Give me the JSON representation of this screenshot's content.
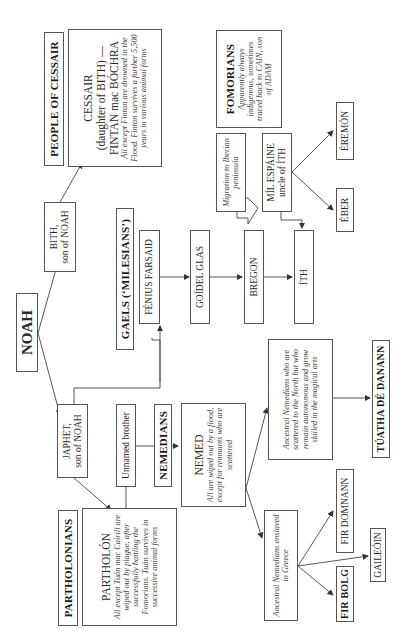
{
  "diagram": {
    "orientation": "rotated-90-ccw",
    "root": {
      "label": "NOAH"
    },
    "sons": [
      {
        "name": "BITH,",
        "sub": "son of NOAH"
      },
      {
        "name": "JAPHET,",
        "sub": "son of NOAH"
      }
    ],
    "cessair": {
      "group_title": "PEOPLE OF CESSAIR",
      "name": "CESSAIR",
      "line2": "(daughter of BITH) —",
      "line3": "FINTAN mac BÓCHRA",
      "note": "All except Fintan are drowned in the Flood. Fintan survives a further 5,500 years in various animal forms"
    },
    "partholonians": {
      "group_title": "PARTHOLONIANS",
      "name": "PARTHOLÓN",
      "note": "All except Tuán mac Cairill are wiped out by plague, after successfully battling the Fomorians. Tuán survives in successive animal forms"
    },
    "unnamed_brother": {
      "label": "Unnamed brother"
    },
    "nemedians": {
      "group_title": "NEMEDIANS",
      "name": "NEMED",
      "note": "All are wiped out by a flood, except for remnants who are scattered"
    },
    "greece_branch": {
      "note": "Ancestral Nemedians enslaved in Greece",
      "fir_bolg": "FIR BOLG",
      "gaileoin": "GAILEÓIN",
      "fir_domnann": "FIR DOMNANN"
    },
    "north_branch": {
      "note": "Ancestral Nemedians who are scattered to the North but who remain autonomous and grow skilled in the magical arts",
      "tuatha": "TÚATHA DÉ DANANN"
    },
    "gaels": {
      "group_title": "GAELS (‘MILESIANS’)",
      "fenius": "FÉNIUS FARSAID",
      "goidel": "GOÍDEL GLAS",
      "migration": "Migration to Iberian peninsula",
      "bregon": "BREGON",
      "ith": "ÍTH",
      "mil_line1": "MÍL ESPÁINE",
      "mil_line2": "uncle of ÍTH",
      "eber": "ÉBER",
      "eremon": "ÉREMÓN"
    },
    "fomorians": {
      "group_title": "FOMORIANS",
      "note": "Apparently always indigenous, sometimes traced back to CAIN, son of ADAM"
    }
  },
  "colors": {
    "line": "#444444",
    "border": "#555555",
    "text": "#2a2a2a"
  }
}
